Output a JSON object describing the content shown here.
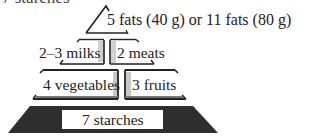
{
  "header": {
    "cut_off_text": "7 starches"
  },
  "pyramid": {
    "title": "Food guide pyramid servings",
    "tiers": [
      {
        "name": "fats",
        "label": "5 fats (40 g) or 11 fats (80 g)"
      },
      {
        "name": "milks",
        "label": "2–3 milks"
      },
      {
        "name": "meats",
        "label": "2 meats"
      },
      {
        "name": "vegetables",
        "label": "4 vegetables"
      },
      {
        "name": "fruits",
        "label": "3 fruits"
      },
      {
        "name": "starches",
        "label": "7 starches"
      }
    ],
    "colors": {
      "dark": "#2e2e2e",
      "light": "#d9d9d9",
      "box": "#ffffff"
    }
  }
}
